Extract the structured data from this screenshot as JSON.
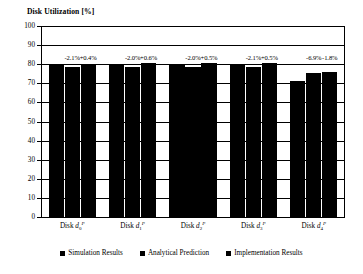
{
  "chart_data": {
    "type": "bar",
    "title": "Disk Utilization [%]",
    "xlabel": "",
    "ylabel": "Disk Utilization [%]",
    "ylim": [
      0,
      100
    ],
    "yticks": [
      0,
      10,
      20,
      30,
      40,
      50,
      60,
      70,
      80,
      90,
      100
    ],
    "grid": true,
    "legend_position": "bottom-center",
    "categories": [
      "Disk d0P",
      "Disk d1P",
      "Disk d2P",
      "Disk d3P",
      "Disk d4P"
    ],
    "category_labels": [
      {
        "prefix": "Disk ",
        "var": "d",
        "sub": "0",
        "sup": "P"
      },
      {
        "prefix": "Disk ",
        "var": "d",
        "sub": "1",
        "sup": "P"
      },
      {
        "prefix": "Disk ",
        "var": "d",
        "sub": "2",
        "sup": "P"
      },
      {
        "prefix": "Disk ",
        "var": "d",
        "sub": "3",
        "sup": "P"
      },
      {
        "prefix": "Disk ",
        "var": "d",
        "sub": "4",
        "sup": "P"
      }
    ],
    "series": [
      {
        "name": "Simulation Results",
        "values": [
          80.0,
          80.0,
          80.0,
          80.0,
          71.0
        ]
      },
      {
        "name": "Analytical Prediction",
        "values": [
          78.3,
          78.4,
          78.4,
          78.3,
          75.5
        ]
      },
      {
        "name": "Implementation Results",
        "values": [
          80.3,
          80.5,
          80.4,
          80.4,
          75.8
        ]
      }
    ],
    "annotations": [
      {
        "group": 0,
        "series": 1,
        "text": "-2.1%"
      },
      {
        "group": 0,
        "series": 2,
        "text": "+0.4%"
      },
      {
        "group": 1,
        "series": 1,
        "text": "-2.0%"
      },
      {
        "group": 1,
        "series": 2,
        "text": "+0.6%"
      },
      {
        "group": 2,
        "series": 1,
        "text": "-2.0%"
      },
      {
        "group": 2,
        "series": 2,
        "text": "+0.5%"
      },
      {
        "group": 3,
        "series": 1,
        "text": "-2.1%"
      },
      {
        "group": 3,
        "series": 2,
        "text": "+0.5%"
      },
      {
        "group": 4,
        "series": 1,
        "text": "-6.9%"
      },
      {
        "group": 4,
        "series": 2,
        "text": "-1.8%"
      }
    ],
    "bar_color": "#000000",
    "axis_color": "#000000",
    "background": "#ffffff"
  },
  "legend": {
    "items": [
      {
        "label": "Simulation Results",
        "color": "#000000"
      },
      {
        "label": "Analytical Prediction",
        "color": "#000000"
      },
      {
        "label": "Implementation Results",
        "color": "#000000"
      }
    ]
  }
}
